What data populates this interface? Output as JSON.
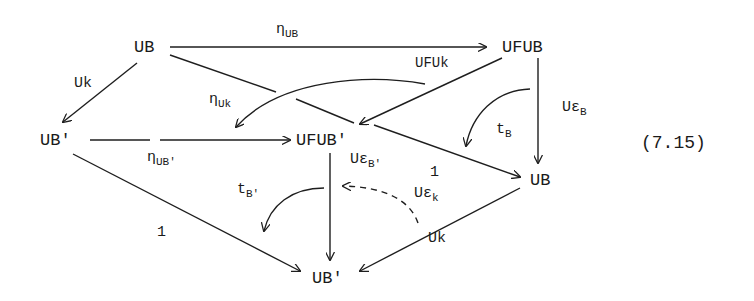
{
  "equation_number": "(7.15)",
  "nodes": {
    "ub_top": "UB",
    "ufub_top": "UFUB",
    "ub_prime_left": "UB'",
    "ufub_prime_center": "UFUB'",
    "ub_right": "UB",
    "ub_prime_bottom": "UB'"
  },
  "labels": {
    "eta_ub": {
      "main": "η",
      "sub": "UB"
    },
    "ufuk": {
      "main": "UFUk",
      "sub": ""
    },
    "uk_left": {
      "main": "Uk",
      "sub": ""
    },
    "eta_uk": {
      "main": "η",
      "sub": "Uk"
    },
    "eta_ub_prime": {
      "main": "η",
      "sub": "UB'"
    },
    "u_eps_b": {
      "main": "Uε",
      "sub": "B"
    },
    "t_b": {
      "main": "t",
      "sub": "B"
    },
    "u_eps_b_prime": {
      "main": "Uε",
      "sub": "B'"
    },
    "one_right": {
      "main": "1",
      "sub": ""
    },
    "u_eps_k": {
      "main": "Uε",
      "sub": "k"
    },
    "t_b_prime": {
      "main": "t",
      "sub": "B'"
    },
    "one_left": {
      "main": "1",
      "sub": ""
    },
    "uk_bottom": {
      "main": "Uk",
      "sub": ""
    }
  },
  "edges": [
    {
      "from": "UB",
      "to": "UFUB",
      "label": "η_UB",
      "style": "solid"
    },
    {
      "from": "UFUB",
      "to": "UFUB'",
      "label": "UFUk",
      "style": "solid"
    },
    {
      "from": "UB",
      "to": "UB'",
      "label": "Uk",
      "style": "solid"
    },
    {
      "from": "UB",
      "to": "UB (right)",
      "label": "1",
      "style": "solid"
    },
    {
      "from": "UB'",
      "to": "UFUB'",
      "label": "η_UB'",
      "style": "solid"
    },
    {
      "from": "UFUB",
      "to": "UB (right)",
      "label": "Uε_B",
      "style": "solid"
    },
    {
      "from": "UFUB'",
      "to": "UB' (bottom)",
      "label": "Uε_B'",
      "style": "solid"
    },
    {
      "from": "UB' (left)",
      "to": "UB' (bottom)",
      "label": "1",
      "style": "solid"
    },
    {
      "from": "UB (right)",
      "to": "UB' (bottom)",
      "label": "Uk",
      "style": "solid"
    },
    {
      "type": "2-cell",
      "label": "η_Uk",
      "style": "curved"
    },
    {
      "type": "2-cell",
      "label": "t_B",
      "style": "curved"
    },
    {
      "type": "2-cell",
      "label": "t_B'",
      "style": "curved"
    },
    {
      "type": "2-cell",
      "label": "Uε_k",
      "style": "curved-dashed"
    }
  ]
}
